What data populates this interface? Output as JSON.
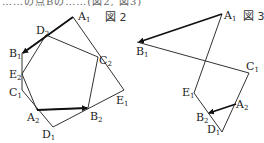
{
  "header_fragment": "……の点Bの……(図2, 図3)",
  "figure2": {
    "caption": "図 2",
    "pentagon1": [
      "A1",
      "E1",
      "D1",
      "C1",
      "B1"
    ],
    "pentagon2": [
      "A2",
      "B2",
      "C2",
      "D2",
      "E2"
    ],
    "labels": {
      "A1": {
        "base": "A",
        "sub": "1"
      },
      "B1": {
        "base": "B",
        "sub": "1"
      },
      "C1": {
        "base": "C",
        "sub": "1"
      },
      "D1": {
        "base": "D",
        "sub": "1"
      },
      "E1": {
        "base": "E",
        "sub": "1"
      },
      "A2": {
        "base": "A",
        "sub": "2"
      },
      "B2": {
        "base": "B",
        "sub": "2"
      },
      "C2": {
        "base": "C",
        "sub": "2"
      },
      "D2": {
        "base": "D",
        "sub": "2"
      },
      "E2": {
        "base": "E",
        "sub": "2"
      }
    },
    "arrows": [
      [
        "D2",
        "B1"
      ],
      [
        "A2",
        "B2"
      ]
    ]
  },
  "figure3": {
    "caption": "図 3",
    "labels": {
      "A1": {
        "base": "A",
        "sub": "1"
      },
      "B1": {
        "base": "B",
        "sub": "1"
      },
      "C1": {
        "base": "C",
        "sub": "1"
      },
      "D1": {
        "base": "D",
        "sub": "1"
      },
      "E1": {
        "base": "E",
        "sub": "1"
      },
      "A2": {
        "base": "A",
        "sub": "2"
      },
      "B2": {
        "base": "B",
        "sub": "2"
      }
    },
    "arrows": [
      [
        "A1",
        "B1"
      ],
      [
        "A2",
        "B2"
      ]
    ]
  },
  "colors": {
    "line": "#333333",
    "arrow": "#111111",
    "text": "#222222"
  }
}
